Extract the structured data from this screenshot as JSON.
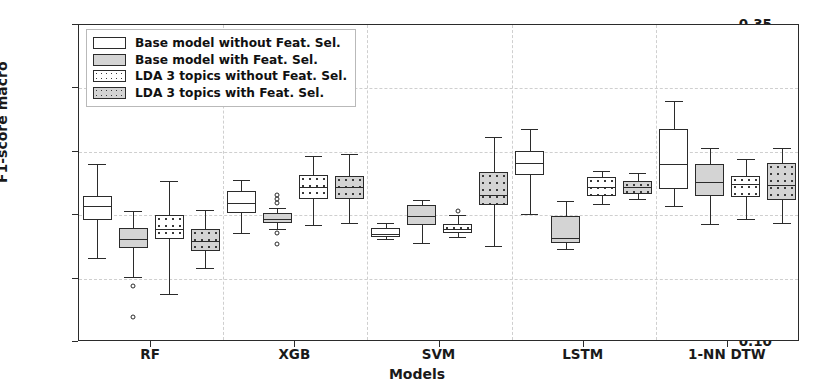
{
  "chart_data": {
    "type": "box",
    "title": "",
    "xlabel": "Models",
    "ylabel": "F1-score macro",
    "ylim": [
      0.1,
      0.35
    ],
    "yticks": [
      0.1,
      0.15,
      0.2,
      0.25,
      0.3,
      0.35
    ],
    "ytick_labels": [
      "0.10",
      "0.15",
      "0.20",
      "0.25",
      "0.30",
      "0.35"
    ],
    "categories": [
      "RF",
      "XGB",
      "SVM",
      "LSTM",
      "1-NN DTW"
    ],
    "grid": true,
    "legend_position": "upper left",
    "legend": [
      {
        "label": "Base model without Feat. Sel.",
        "fill": "#ffffff",
        "hatch": "none"
      },
      {
        "label": "Base model with Feat. Sel.",
        "fill": "#d4d4d4",
        "hatch": "none"
      },
      {
        "label": "LDA 3 topics without Feat. Sel.",
        "fill": "#ffffff",
        "hatch": "dots"
      },
      {
        "label": "LDA 3 topics with Feat. Sel.",
        "fill": "#d4d4d4",
        "hatch": "dots"
      }
    ],
    "series": [
      {
        "name": "Base model without Feat. Sel.",
        "fill": "#ffffff",
        "hatch": "none",
        "boxes": [
          {
            "category": "RF",
            "whisker_low": 0.166,
            "q1": 0.196,
            "median": 0.207,
            "q3": 0.215,
            "whisker_high": 0.24,
            "outliers": []
          },
          {
            "category": "XGB",
            "whisker_low": 0.186,
            "q1": 0.202,
            "median": 0.21,
            "q3": 0.219,
            "whisker_high": 0.228,
            "outliers": []
          },
          {
            "category": "SVM",
            "whisker_low": 0.181,
            "q1": 0.183,
            "median": 0.185,
            "q3": 0.19,
            "whisker_high": 0.194,
            "outliers": []
          },
          {
            "category": "LSTM",
            "whisker_low": 0.201,
            "q1": 0.232,
            "median": 0.241,
            "q3": 0.251,
            "whisker_high": 0.268,
            "outliers": []
          },
          {
            "category": "1-NN DTW",
            "whisker_low": 0.207,
            "q1": 0.221,
            "median": 0.24,
            "q3": 0.268,
            "whisker_high": 0.29,
            "outliers": []
          }
        ]
      },
      {
        "name": "Base model with Feat. Sel.",
        "fill": "#d4d4d4",
        "hatch": "none",
        "boxes": [
          {
            "category": "RF",
            "whisker_low": 0.151,
            "q1": 0.174,
            "median": 0.181,
            "q3": 0.19,
            "whisker_high": 0.203,
            "outliers": [
              0.144,
              0.12
            ]
          },
          {
            "category": "XGB",
            "whisker_low": 0.189,
            "q1": 0.194,
            "median": 0.197,
            "q3": 0.202,
            "whisker_high": 0.206,
            "outliers": [
              0.216,
              0.213,
              0.21,
              0.186,
              0.177
            ]
          },
          {
            "category": "SVM",
            "whisker_low": 0.178,
            "q1": 0.192,
            "median": 0.199,
            "q3": 0.208,
            "whisker_high": 0.212,
            "outliers": []
          },
          {
            "category": "LSTM",
            "whisker_low": 0.173,
            "q1": 0.178,
            "median": 0.182,
            "q3": 0.199,
            "whisker_high": 0.211,
            "outliers": []
          },
          {
            "category": "1-NN DTW",
            "whisker_low": 0.193,
            "q1": 0.215,
            "median": 0.226,
            "q3": 0.24,
            "whisker_high": 0.253,
            "outliers": []
          }
        ]
      },
      {
        "name": "LDA 3 topics without Feat. Sel.",
        "fill": "#ffffff",
        "hatch": "dots",
        "boxes": [
          {
            "category": "RF",
            "whisker_low": 0.138,
            "q1": 0.181,
            "median": 0.189,
            "q3": 0.2,
            "whisker_high": 0.227,
            "outliers": []
          },
          {
            "category": "XGB",
            "whisker_low": 0.192,
            "q1": 0.213,
            "median": 0.222,
            "q3": 0.232,
            "whisker_high": 0.247,
            "outliers": []
          },
          {
            "category": "SVM",
            "whisker_low": 0.183,
            "q1": 0.186,
            "median": 0.189,
            "q3": 0.193,
            "whisker_high": 0.2,
            "outliers": [
              0.203
            ]
          },
          {
            "category": "LSTM",
            "whisker_low": 0.209,
            "q1": 0.215,
            "median": 0.222,
            "q3": 0.23,
            "whisker_high": 0.235,
            "outliers": []
          },
          {
            "category": "1-NN DTW",
            "whisker_low": 0.197,
            "q1": 0.214,
            "median": 0.225,
            "q3": 0.231,
            "whisker_high": 0.244,
            "outliers": []
          }
        ]
      },
      {
        "name": "LDA 3 topics with Feat. Sel.",
        "fill": "#d4d4d4",
        "hatch": "dots",
        "boxes": [
          {
            "category": "RF",
            "whisker_low": 0.158,
            "q1": 0.172,
            "median": 0.18,
            "q3": 0.189,
            "whisker_high": 0.204,
            "outliers": []
          },
          {
            "category": "XGB",
            "whisker_low": 0.194,
            "q1": 0.213,
            "median": 0.222,
            "q3": 0.231,
            "whisker_high": 0.248,
            "outliers": []
          },
          {
            "category": "SVM",
            "whisker_low": 0.176,
            "q1": 0.208,
            "median": 0.216,
            "q3": 0.234,
            "whisker_high": 0.262,
            "outliers": []
          },
          {
            "category": "LSTM",
            "whisker_low": 0.213,
            "q1": 0.217,
            "median": 0.222,
            "q3": 0.227,
            "whisker_high": 0.233,
            "outliers": []
          },
          {
            "category": "1-NN DTW",
            "whisker_low": 0.194,
            "q1": 0.212,
            "median": 0.224,
            "q3": 0.241,
            "whisker_high": 0.253,
            "outliers": []
          }
        ]
      }
    ]
  }
}
